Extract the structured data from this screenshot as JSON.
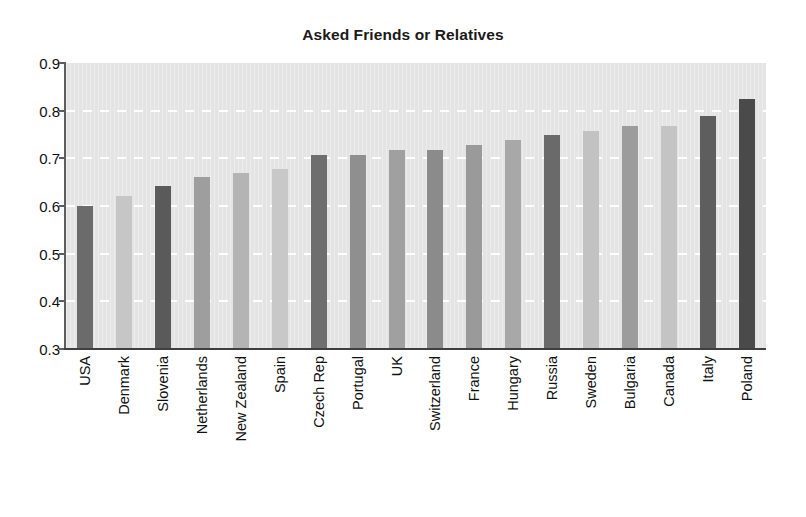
{
  "chart_data": {
    "type": "bar",
    "title": "Asked Friends or Relatives",
    "xlabel": "",
    "ylabel": "",
    "ylim": [
      0.3,
      0.9
    ],
    "ytick_labels": [
      "0.9",
      "0.8",
      "0.7",
      "0.6",
      "0.5",
      "0.4",
      "0.3"
    ],
    "yticks": [
      0.9,
      0.8,
      0.7,
      0.6,
      0.5,
      0.4,
      0.3
    ],
    "grid": "horizontal-dashed-white",
    "legend": null,
    "plot_background": "#e4e4e4",
    "categories": [
      "USA",
      "Denmark",
      "Slovenia",
      "Netherlands",
      "New Zealand",
      "Spain",
      "Czech Rep",
      "Portugal",
      "UK",
      "Switzerland",
      "France",
      "Hungary",
      "Russia",
      "Sweden",
      "Bulgaria",
      "Canada",
      "Italy",
      "Poland"
    ],
    "values": [
      0.6,
      0.62,
      0.641,
      0.66,
      0.669,
      0.678,
      0.708,
      0.708,
      0.717,
      0.717,
      0.728,
      0.738,
      0.748,
      0.757,
      0.768,
      0.768,
      0.788,
      0.825
    ],
    "bar_colors": [
      "#6b6b6b",
      "#c6c6c6",
      "#5a5a5a",
      "#9e9e9e",
      "#b4b4b4",
      "#c8c8c8",
      "#6e6e6e",
      "#8f8f8f",
      "#a0a0a0",
      "#8b8b8b",
      "#9a9a9a",
      "#a8a8a8",
      "#6a6a6a",
      "#c2c2c2",
      "#9c9c9c",
      "#c4c4c4",
      "#5e5e5e",
      "#4a4a4a"
    ]
  }
}
